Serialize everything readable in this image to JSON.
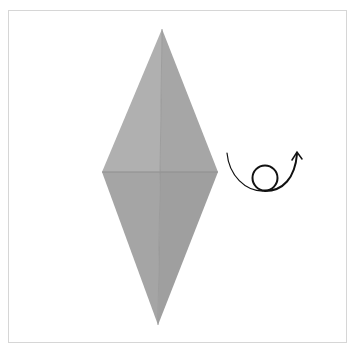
{
  "diagram": {
    "type": "origami-step",
    "frame": {
      "border_color": "#d6d6d6",
      "background": "#ffffff"
    },
    "paper": {
      "points": {
        "top": [
          162,
          29
        ],
        "left": [
          102,
          172
        ],
        "right": [
          218,
          172
        ],
        "bottom": [
          158,
          325
        ]
      },
      "crease_center": [
        160,
        172
      ],
      "colors": {
        "upper_left": "#b0b0b0",
        "upper_right": "#a6a6a6",
        "lower_left": "#a5a5a5",
        "lower_right": "#9f9f9f",
        "crease": "#8f8f8f"
      }
    },
    "symbol": {
      "name": "turn-over",
      "meaning": "Turn the model over",
      "color": "#111111",
      "loop_center": [
        265,
        177
      ],
      "loop_radius": 12
    }
  }
}
